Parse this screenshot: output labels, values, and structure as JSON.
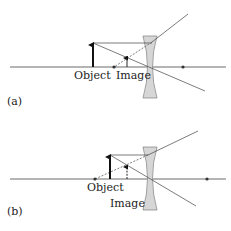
{
  "panels": [
    {
      "id": "a",
      "label": "(a)",
      "object_label": "Object",
      "image_label": "Image"
    },
    {
      "id": "b",
      "label": "(b)",
      "object_label": "Object",
      "image_label": "Image"
    }
  ],
  "colors": {
    "line": "#333333",
    "lens_fill": "#d6d6d6",
    "lens_stroke": "#8a8a8a"
  }
}
